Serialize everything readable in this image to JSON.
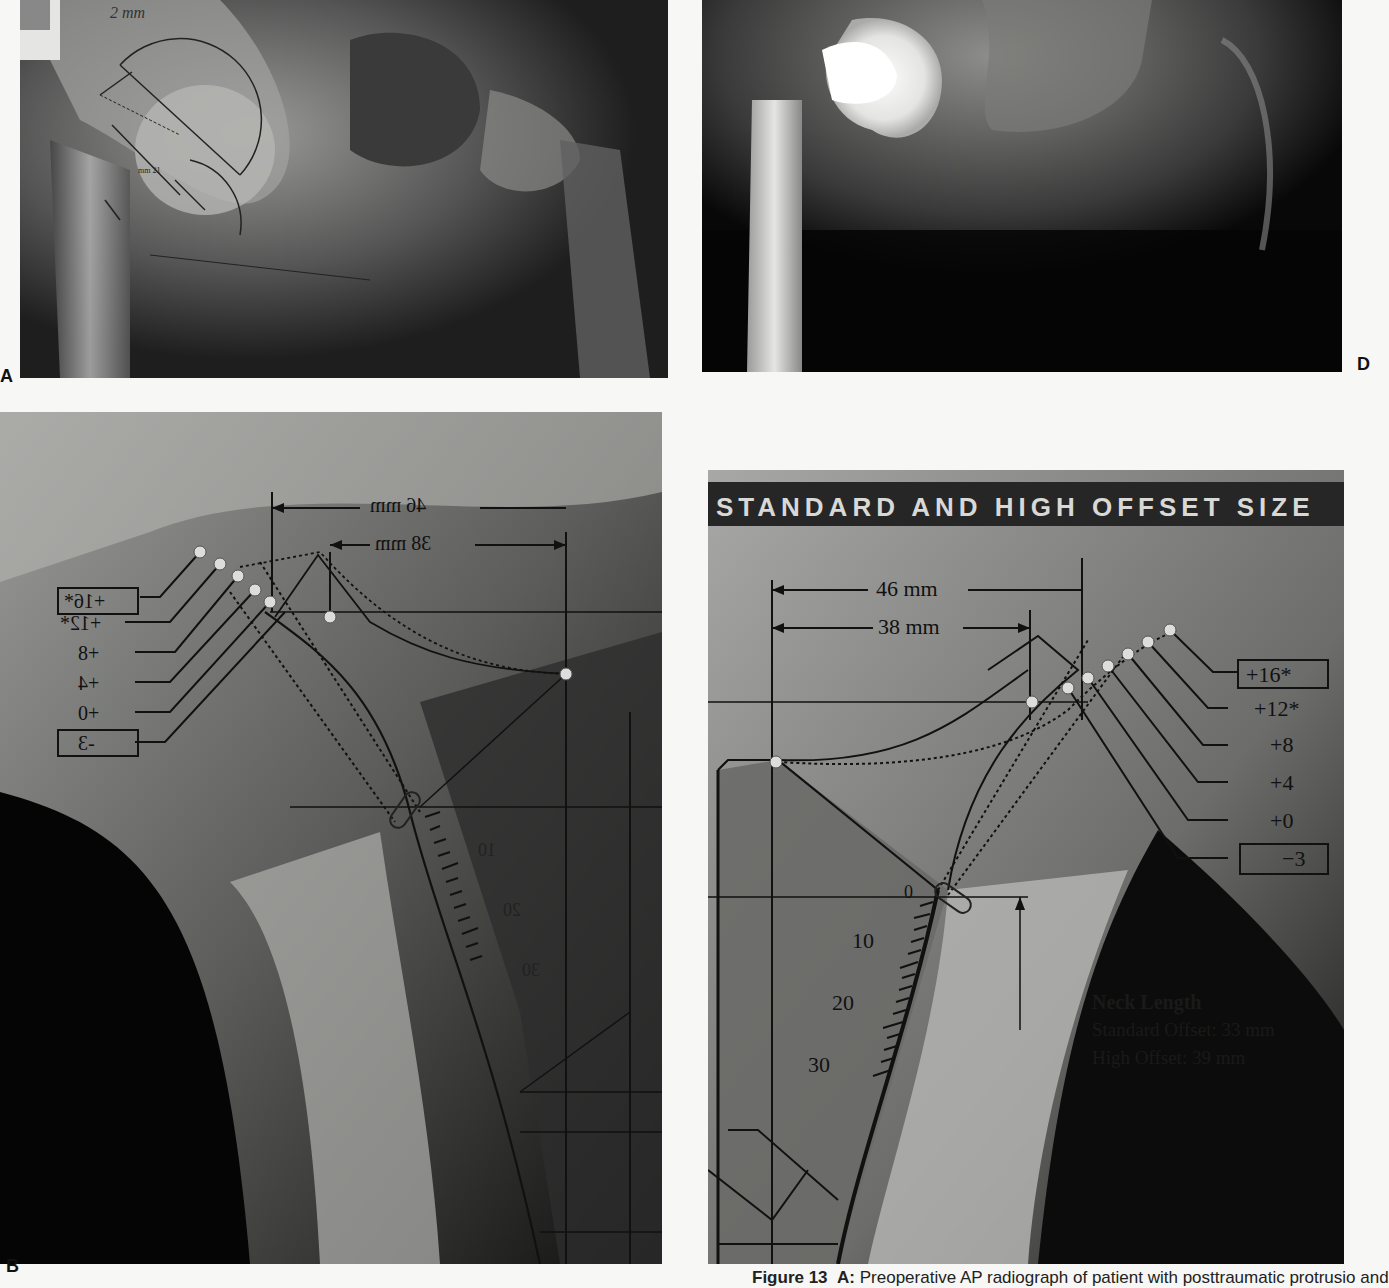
{
  "figure": {
    "panels": {
      "a": {
        "letter": "A",
        "description": "Preoperative AP radiograph with handwritten templating",
        "annotations": {
          "handwritten_note": "2 mm",
          "measurement_label": "mm 21"
        }
      },
      "d": {
        "letter": "D",
        "description": "Postoperative AP radiograph with hip prosthesis"
      },
      "b": {
        "letter": "B",
        "description": "Mirrored template overlay on radiograph",
        "dimensions": [
          "46 mm",
          "38 mm"
        ],
        "offset_labels": [
          "+16*",
          "+12*",
          "+8",
          "+4",
          "+0",
          "-3"
        ],
        "scale_labels": [
          "10",
          "20",
          "30"
        ]
      },
      "c": {
        "letter": "C",
        "banner": "STANDARD AND HIGH OFFSET SIZE",
        "dimensions": [
          "46 mm",
          "38 mm"
        ],
        "offset_labels": [
          "+16*",
          "+12*",
          "+8",
          "+4",
          "+0",
          "−3"
        ],
        "boxed_labels": [
          "+16*",
          "−3"
        ],
        "scale_labels": [
          "0",
          "10",
          "20",
          "30"
        ],
        "neck_length": {
          "title": "Neck Length",
          "standard": "Standard Offset: 33 mm",
          "high": "High Offset: 39 mm"
        }
      }
    },
    "caption": {
      "label": "Figure 13",
      "part": "A:",
      "text": "Preoperative AP radiograph of patient with posttraumatic protrusio and"
    }
  }
}
